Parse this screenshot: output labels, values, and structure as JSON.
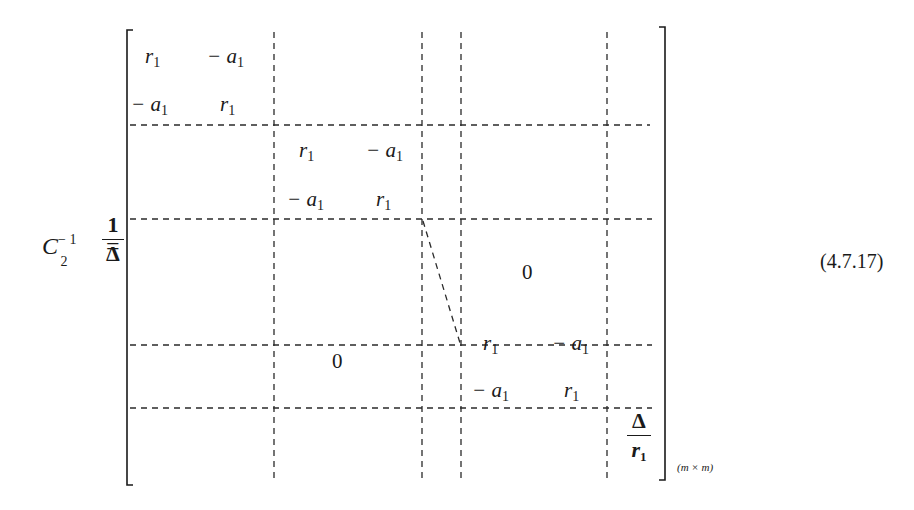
{
  "equation": {
    "lhs_symbol": "C",
    "lhs_subscript": "2",
    "lhs_superscript": "− 1",
    "equals": "=",
    "prefactor": {
      "numerator": "1",
      "denominator": "Δ"
    },
    "dimension_label": "(m × m)",
    "equation_number": "(4.7.17)"
  },
  "matrix": {
    "blocks": [
      {
        "r1c1": "r",
        "r1c1_sub": "1",
        "r1c2": "− a",
        "r1c2_sub": "1",
        "r2c1": "− a",
        "r2c1_sub": "1",
        "r2c2": "r",
        "r2c2_sub": "1"
      },
      {
        "r1c1": "r",
        "r1c1_sub": "1",
        "r1c2": "− a",
        "r1c2_sub": "1",
        "r2c1": "− a",
        "r2c1_sub": "1",
        "r2c2": "r",
        "r2c2_sub": "1"
      },
      {
        "r1c1": "r",
        "r1c1_sub": "1",
        "r1c2": "− a",
        "r1c2_sub": "1",
        "r2c1": "− a",
        "r2c1_sub": "1",
        "r2c2": "r",
        "r2c2_sub": "1"
      }
    ],
    "upper_zero": "0",
    "lower_zero": "0",
    "last_entry": {
      "numerator": "Δ",
      "denominator": "r",
      "denominator_sub": "1"
    }
  }
}
